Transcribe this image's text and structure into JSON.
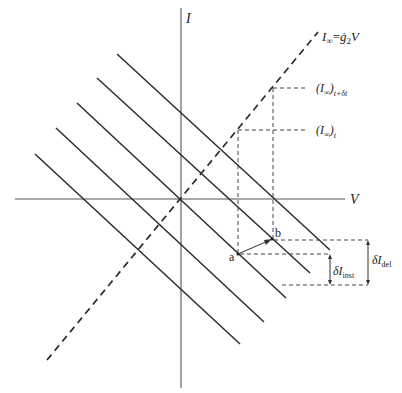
{
  "diagram": {
    "axes": {
      "y_label": "I",
      "x_label": "V"
    },
    "asymptote_label": {
      "main": "I",
      "sub": "∞",
      "eq": "=",
      "g": "ġ",
      "g_sub": "2",
      "v": "V"
    },
    "level_labels": [
      {
        "main": "(I",
        "sub_inf": "∞",
        "close": ")",
        "sub": "t+δt"
      },
      {
        "main": "(I",
        "sub_inf": "∞",
        "close": ")",
        "sub": "t"
      }
    ],
    "points": [
      {
        "label": "a"
      },
      {
        "label": "b"
      }
    ],
    "deltas": [
      {
        "main": "δI",
        "sub": "inst"
      },
      {
        "main": "δI",
        "sub": "del"
      }
    ],
    "parallel_lines_count": 5,
    "line_style": {
      "solid_color": "#2b2b2b",
      "axis_color": "#555555"
    }
  }
}
